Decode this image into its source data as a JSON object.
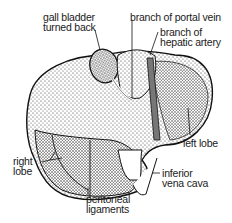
{
  "diagram": {
    "labels": {
      "gall_bladder_1": "gall bladder",
      "gall_bladder_2": "turned back",
      "portal_vein": "branch of portal vein",
      "hepatic_artery_1": "branch of",
      "hepatic_artery_2": "hepatic artery",
      "left_lobe": "left lobe",
      "right_lobe_1": "right",
      "right_lobe_2": "lobe",
      "inferior_vena_cava_1": "inferior",
      "inferior_vena_cava_2": "vena cava",
      "peritoneal_1": "peritoneal",
      "peritoneal_2": "ligaments"
    },
    "colors": {
      "ink": "#1a1a1a",
      "background": "#ffffff"
    }
  }
}
